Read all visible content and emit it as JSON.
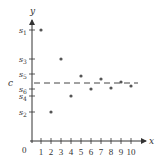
{
  "chart_data": {
    "type": "scatter",
    "title": "",
    "xlabel": "x",
    "ylabel": "y",
    "origin_label": "0",
    "x_ticks": [
      1,
      2,
      3,
      4,
      5,
      6,
      7,
      8,
      9,
      10
    ],
    "y_tick_labels": [
      {
        "label": "s1",
        "sub": "1",
        "py": 30
      },
      {
        "label": "s3",
        "sub": "3",
        "py": 59
      },
      {
        "label": "s5",
        "sub": "5",
        "py": 74
      },
      {
        "label": "s6",
        "sub": "6",
        "py": 89
      },
      {
        "label": "s4",
        "sub": "4",
        "py": 96
      },
      {
        "label": "s2",
        "sub": "2",
        "py": 112
      }
    ],
    "points": [
      {
        "x": 1,
        "py": 30
      },
      {
        "x": 2,
        "py": 112
      },
      {
        "x": 3,
        "py": 59
      },
      {
        "x": 4,
        "py": 96
      },
      {
        "x": 5,
        "py": 76
      },
      {
        "x": 6,
        "py": 89
      },
      {
        "x": 7,
        "py": 79
      },
      {
        "x": 8,
        "py": 88
      },
      {
        "x": 9,
        "py": 82
      },
      {
        "x": 10,
        "py": 86
      }
    ],
    "limit_line": {
      "label": "c",
      "py": 83,
      "style": "dashed"
    }
  },
  "colors": {
    "axis": "#333333",
    "point": "#555555",
    "dash": "#444444"
  }
}
